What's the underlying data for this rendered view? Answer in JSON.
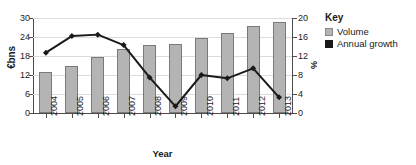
{
  "chart_data": {
    "type": "bar",
    "title": "",
    "xlabel": "Year",
    "ylabel": "€bns",
    "y2label": "%",
    "categories": [
      "2004",
      "2005",
      "2006",
      "2007",
      "2008",
      "2009",
      "2010",
      "2011",
      "2012",
      "2013"
    ],
    "ylim": [
      0,
      30
    ],
    "yticks": [
      0,
      6,
      12,
      18,
      24,
      30
    ],
    "y2lim": [
      0,
      20
    ],
    "y2ticks": [
      0,
      4,
      8,
      12,
      16,
      20
    ],
    "grid": true,
    "legend_position": "right",
    "series": [
      {
        "name": "Volume",
        "type": "bar",
        "axis": "left",
        "unit": "€bns",
        "color": "#b4b4b4",
        "values": [
          12.9,
          15.0,
          17.8,
          20.2,
          21.6,
          21.7,
          23.6,
          25.3,
          27.6,
          28.8
        ]
      },
      {
        "name": "Annual growth",
        "type": "line",
        "axis": "right",
        "unit": "%",
        "color": "#1a1a1a",
        "values": [
          12.7,
          16.2,
          16.5,
          14.3,
          7.5,
          1.4,
          8.0,
          7.3,
          9.4,
          3.3
        ]
      }
    ]
  },
  "legend": {
    "title": "Key",
    "items": [
      {
        "label": "Volume",
        "swatch": "gray-square-icon"
      },
      {
        "label": "Annual growth",
        "swatch": "black-square-icon"
      }
    ]
  }
}
